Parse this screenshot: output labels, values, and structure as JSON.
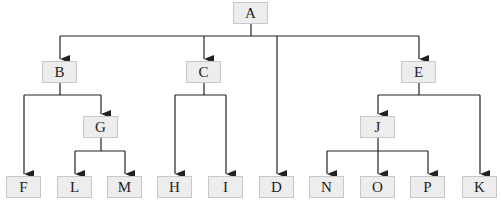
{
  "diagram": {
    "type": "tree",
    "colors": {
      "node_fill": "#ededed",
      "node_border": "#c8c8c8",
      "edge": "#222222"
    },
    "nodes": {
      "A": {
        "label": "A"
      },
      "B": {
        "label": "B"
      },
      "C": {
        "label": "C"
      },
      "D": {
        "label": "D"
      },
      "E": {
        "label": "E"
      },
      "F": {
        "label": "F"
      },
      "G": {
        "label": "G"
      },
      "H": {
        "label": "H"
      },
      "I": {
        "label": "I"
      },
      "J": {
        "label": "J"
      },
      "K": {
        "label": "K"
      },
      "L": {
        "label": "L"
      },
      "M": {
        "label": "M"
      },
      "N": {
        "label": "N"
      },
      "O": {
        "label": "O"
      },
      "P": {
        "label": "P"
      }
    },
    "edges": [
      [
        "A",
        "B"
      ],
      [
        "A",
        "C"
      ],
      [
        "A",
        "D"
      ],
      [
        "A",
        "E"
      ],
      [
        "B",
        "F"
      ],
      [
        "B",
        "G"
      ],
      [
        "G",
        "L"
      ],
      [
        "G",
        "M"
      ],
      [
        "C",
        "H"
      ],
      [
        "C",
        "I"
      ],
      [
        "E",
        "J"
      ],
      [
        "E",
        "K"
      ],
      [
        "J",
        "N"
      ],
      [
        "J",
        "O"
      ],
      [
        "J",
        "P"
      ]
    ]
  }
}
